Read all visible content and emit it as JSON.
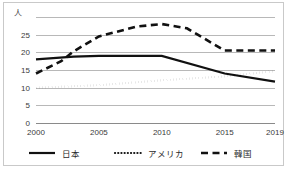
{
  "chart_data": {
    "type": "line",
    "title": "",
    "subtitle": "",
    "xlabel": "",
    "ylabel": "",
    "unit_label": "人",
    "x": [
      2000,
      2005,
      2010,
      2015,
      2019
    ],
    "xtick_labels": [
      "2000",
      "2005",
      "2010",
      "2015",
      "2019"
    ],
    "ytick_labels": [
      "0",
      "5",
      "10",
      "15",
      "20",
      "25"
    ],
    "ytick_values": [
      0,
      5,
      10,
      15,
      20,
      25
    ],
    "ylim": [
      0,
      30
    ],
    "xlim": [
      2000,
      2019
    ],
    "grid": true,
    "legend_position": "bottom",
    "series": [
      {
        "name": "日本",
        "style": "solid",
        "color": "#111111",
        "values": [
          18.0,
          19.0,
          19.0,
          14.0,
          11.7
        ],
        "points": [
          {
            "x": 2000,
            "y": 18.0
          },
          {
            "x": 2003,
            "y": 18.8
          },
          {
            "x": 2005,
            "y": 19.0
          },
          {
            "x": 2010,
            "y": 19.0
          },
          {
            "x": 2015,
            "y": 14.0
          },
          {
            "x": 2019,
            "y": 11.7
          }
        ]
      },
      {
        "name": "アメリカ",
        "style": "dotted",
        "color": "#111111",
        "values": [
          10.0,
          10.7,
          12.1,
          13.2,
          14.7
        ],
        "points": [
          {
            "x": 2000,
            "y": 10.0
          },
          {
            "x": 2005,
            "y": 10.7
          },
          {
            "x": 2010,
            "y": 12.1
          },
          {
            "x": 2015,
            "y": 13.2
          },
          {
            "x": 2019,
            "y": 14.7
          }
        ]
      },
      {
        "name": "韓国",
        "style": "dashed",
        "color": "#111111",
        "values": [
          14.0,
          24.5,
          28.0,
          20.5,
          20.5
        ],
        "points": [
          {
            "x": 2000,
            "y": 14.0
          },
          {
            "x": 2002,
            "y": 17.5
          },
          {
            "x": 2003,
            "y": 20.3
          },
          {
            "x": 2005,
            "y": 24.5
          },
          {
            "x": 2008,
            "y": 27.3
          },
          {
            "x": 2010,
            "y": 28.0
          },
          {
            "x": 2012,
            "y": 26.8
          },
          {
            "x": 2015,
            "y": 20.5
          },
          {
            "x": 2019,
            "y": 20.5
          }
        ]
      }
    ]
  },
  "legend": {
    "items": [
      {
        "label": "日本",
        "style": "solid"
      },
      {
        "label": "アメリカ",
        "style": "dotted"
      },
      {
        "label": "韓国",
        "style": "dashed"
      }
    ]
  }
}
